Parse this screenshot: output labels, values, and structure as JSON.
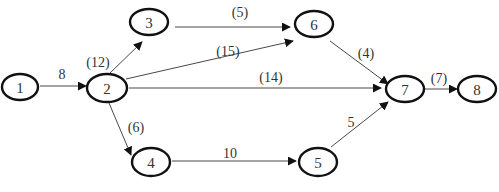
{
  "diagram": {
    "type": "activity-network",
    "nodes": [
      {
        "id": "1",
        "label": "1",
        "cx": 20,
        "cy": 87,
        "rx": 18,
        "ry": 13
      },
      {
        "id": "2",
        "label": "2",
        "cx": 107,
        "cy": 88,
        "rx": 20,
        "ry": 14
      },
      {
        "id": "3",
        "label": "3",
        "cx": 149,
        "cy": 22,
        "rx": 19,
        "ry": 13
      },
      {
        "id": "6",
        "label": "6",
        "cx": 314,
        "cy": 24,
        "rx": 19,
        "ry": 13
      },
      {
        "id": "7",
        "label": "7",
        "cx": 405,
        "cy": 89,
        "rx": 19,
        "ry": 13
      },
      {
        "id": "8",
        "label": "8",
        "cx": 477,
        "cy": 89,
        "rx": 19,
        "ry": 13
      },
      {
        "id": "4",
        "label": "4",
        "cx": 151,
        "cy": 162,
        "rx": 19,
        "ry": 14
      },
      {
        "id": "5",
        "label": "5",
        "cx": 318,
        "cy": 162,
        "rx": 19,
        "ry": 14
      }
    ],
    "edges": [
      {
        "from": "1",
        "to": "2",
        "label": "8",
        "x1": 40,
        "y1": 86,
        "x2": 86,
        "y2": 86,
        "lx": 62,
        "ly": 79
      },
      {
        "from": "2",
        "to": "3",
        "label": "(12)",
        "x1": 110,
        "y1": 73,
        "x2": 142,
        "y2": 42,
        "lx": 98,
        "ly": 67
      },
      {
        "from": "3",
        "to": "6",
        "label": "(5)",
        "x1": 175,
        "y1": 27,
        "x2": 290,
        "y2": 27,
        "lx": 240,
        "ly": 17
      },
      {
        "from": "2",
        "to": "6",
        "label": "(15)",
        "x1": 126,
        "y1": 79,
        "x2": 293,
        "y2": 41,
        "lx": 228,
        "ly": 56
      },
      {
        "from": "2",
        "to": "7",
        "label": "(14)",
        "x1": 129,
        "y1": 88,
        "x2": 381,
        "y2": 88,
        "lx": 271,
        "ly": 82
      },
      {
        "from": "6",
        "to": "7",
        "label": "(4)",
        "x1": 330,
        "y1": 41,
        "x2": 388,
        "y2": 84,
        "lx": 366,
        "ly": 58
      },
      {
        "from": "7",
        "to": "8",
        "label": "(7)",
        "x1": 425,
        "y1": 89,
        "x2": 457,
        "y2": 89,
        "lx": 439,
        "ly": 83
      },
      {
        "from": "2",
        "to": "4",
        "label": "(6)",
        "x1": 109,
        "y1": 103,
        "x2": 131,
        "y2": 155,
        "lx": 136,
        "ly": 132
      },
      {
        "from": "4",
        "to": "5",
        "label": "10",
        "x1": 172,
        "y1": 161,
        "x2": 296,
        "y2": 161,
        "lx": 230,
        "ly": 158
      },
      {
        "from": "5",
        "to": "7",
        "label": "5",
        "x1": 331,
        "y1": 147,
        "x2": 388,
        "y2": 102,
        "lx": 351,
        "ly": 127
      }
    ]
  }
}
